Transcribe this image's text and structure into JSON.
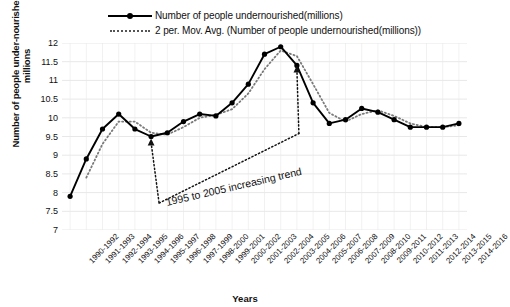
{
  "chart_data": {
    "type": "line",
    "title": "",
    "xlabel": "Years",
    "ylabel": "Number of people under-nourished in millions",
    "ylim": [
      7,
      12
    ],
    "ytick_step": 0.5,
    "grid": true,
    "legend_position": "top",
    "categories": [
      "1990-1992",
      "1991-1993",
      "1992-1994",
      "1993-1995",
      "1994-1996",
      "1995-1997",
      "1996-1998",
      "1997-1999",
      "1998-2000",
      "1999-2001",
      "2000-2002",
      "2001-2003",
      "2002-2004",
      "2003-2005",
      "2004-2006",
      "2005-2007",
      "2006-2008",
      "2007-2009",
      "2008-2010",
      "2009-2011",
      "2010-2012",
      "2011-2013",
      "2012-2014",
      "2013-2015",
      "2014-2016"
    ],
    "yticks": [
      "7",
      "7.5",
      "8",
      "8.5",
      "9",
      "9.5",
      "10",
      "10.5",
      "11",
      "11.5",
      "12"
    ],
    "series": [
      {
        "name": "Number of people undernourished(millions)",
        "style": "solid",
        "marker": "filled-circle",
        "color": "#000000",
        "values": [
          7.9,
          8.9,
          9.7,
          10.1,
          9.7,
          9.5,
          9.6,
          9.9,
          10.1,
          10.05,
          10.4,
          10.9,
          11.7,
          11.9,
          11.4,
          10.4,
          9.85,
          9.95,
          10.25,
          10.15,
          9.95,
          9.75,
          9.75,
          9.75,
          9.85
        ]
      },
      {
        "name": "2 per. Mov. Avg. (Number of people undernourished(millions))",
        "style": "dotted",
        "marker": "none",
        "color": "#7a7a7a",
        "values": [
          null,
          8.4,
          9.3,
          9.9,
          9.9,
          9.6,
          9.55,
          9.75,
          10.0,
          10.08,
          10.23,
          10.65,
          11.3,
          11.8,
          11.65,
          10.9,
          10.13,
          9.9,
          10.1,
          10.2,
          10.05,
          9.85,
          9.75,
          9.75,
          9.8
        ]
      }
    ],
    "annotations": [
      {
        "name": "increasing-trend-annotation",
        "text": "1995 to 2005 increasing trend",
        "from_category": "1995-1997",
        "to_category": "2004-2006",
        "style": "dotted-double-arrow"
      }
    ]
  },
  "legend": {
    "items": [
      {
        "label": "Number of people undernourished(millions)",
        "key": "solid-line-marker-key"
      },
      {
        "label": "2 per. Mov. Avg. (Number of people undernourished(millions))",
        "key": "dotted-line-key"
      }
    ]
  },
  "axes": {
    "x_title": "Years",
    "y_title": "Number of people under-nourished in millions"
  },
  "colors": {
    "series_primary": "#000000",
    "series_moving_average": "#7a7a7a",
    "grid": "#e8e8e8",
    "text": "#111111",
    "background": "#ffffff"
  }
}
